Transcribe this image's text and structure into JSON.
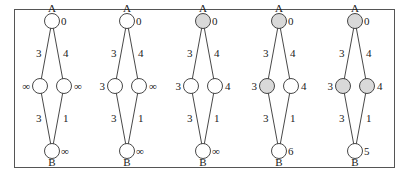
{
  "figure": {
    "colors": {
      "visited_fill": "#d9d9d9",
      "unvisited_fill": "#ffffff",
      "stroke": "#333333"
    },
    "edges": [
      {
        "from": "A",
        "to": "L",
        "weight": "3"
      },
      {
        "from": "A",
        "to": "R",
        "weight": "4"
      },
      {
        "from": "L",
        "to": "B",
        "weight": "3"
      },
      {
        "from": "R",
        "to": "B",
        "weight": "1"
      }
    ],
    "node_names": {
      "A": "A",
      "B": "B"
    },
    "panels": [
      {
        "step": 1,
        "dist": {
          "A": "0",
          "L": "∞",
          "R": "∞",
          "B": "∞"
        },
        "visited": []
      },
      {
        "step": 2,
        "dist": {
          "A": "0",
          "L": "3",
          "R": "∞",
          "B": "∞"
        },
        "visited": []
      },
      {
        "step": 3,
        "dist": {
          "A": "0",
          "L": "3",
          "R": "4",
          "B": "∞"
        },
        "visited": [
          "A"
        ]
      },
      {
        "step": 4,
        "dist": {
          "A": "0",
          "L": "3",
          "R": "4",
          "B": "6"
        },
        "visited": [
          "A",
          "L"
        ]
      },
      {
        "step": 5,
        "dist": {
          "A": "0",
          "L": "3",
          "R": "4",
          "B": "5"
        },
        "visited": [
          "A",
          "L",
          "R"
        ]
      }
    ]
  }
}
